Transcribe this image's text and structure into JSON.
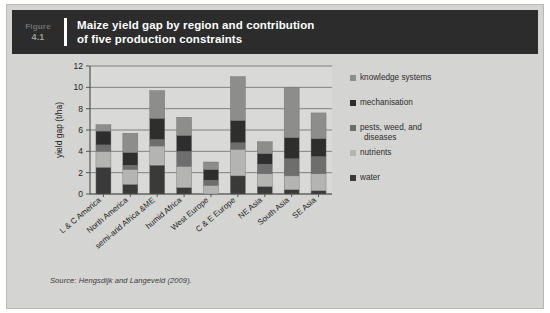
{
  "figure": {
    "label": "Figure",
    "number": "4.1",
    "title_line1": "Maize yield gap by region and contribution",
    "title_line2": "of five production constraints"
  },
  "source": {
    "prefix": "Source:",
    "text": " Hengsdijk and Langeveld (2009)."
  },
  "colors": {
    "header_bg": "#2c2c2c",
    "page_bg": "#d4d4d2",
    "plot_bg": "#d9d9d7",
    "water": "#3a3a3a",
    "nutrients": "#b4b4b2",
    "pests": "#6e6e6e",
    "mechanisation": "#2e2e2e",
    "knowledge": "#8d8d8b",
    "axis": "#555555",
    "grid": "#6b6b6b"
  },
  "chart_data": {
    "type": "bar",
    "stacked": true,
    "title": "Maize yield gap by region and contribution of five production constraints",
    "xlabel": "",
    "ylabel": "yield gap (t/ha)",
    "ylim": [
      0,
      12
    ],
    "yticks": [
      0,
      2,
      4,
      6,
      8,
      10,
      12
    ],
    "ytick_labels": [
      "0",
      "2",
      "4",
      "6",
      "8",
      "10",
      "12"
    ],
    "grid": true,
    "legend_position": "right",
    "categories": [
      "L & C America",
      "North America",
      "semi-arid Africa &ME",
      "humid Africa",
      "West Europe",
      "C & E Europe",
      "NE Asia",
      "South Asia",
      "SE Asia"
    ],
    "series": [
      {
        "name": "water",
        "color": "#3a3a3a",
        "values": [
          2.5,
          0.9,
          2.7,
          0.6,
          0.0,
          1.7,
          0.7,
          0.4,
          0.3
        ]
      },
      {
        "name": "nutrients",
        "color": "#b4b4b2",
        "values": [
          1.5,
          1.4,
          1.8,
          2.0,
          0.8,
          2.5,
          1.2,
          1.3,
          1.6
        ]
      },
      {
        "name": "pests, weed, and diseases",
        "color": "#6e6e6e",
        "values": [
          0.6,
          0.4,
          0.6,
          1.4,
          0.5,
          0.6,
          0.9,
          1.6,
          1.6
        ]
      },
      {
        "name": "mechanisation",
        "color": "#2e2e2e",
        "values": [
          1.3,
          1.2,
          2.0,
          1.5,
          1.0,
          2.1,
          1.0,
          2.0,
          1.7
        ]
      },
      {
        "name": "knowledge systems",
        "color": "#8d8d8b",
        "values": [
          0.6,
          1.8,
          2.6,
          1.7,
          0.7,
          4.1,
          1.1,
          4.7,
          2.4
        ]
      }
    ],
    "totals": [
      6.5,
      5.7,
      9.7,
      7.2,
      3.0,
      11.0,
      4.9,
      10.0,
      7.6
    ],
    "legend_entries": [
      {
        "label": "knowledge systems",
        "color": "#8d8d8b"
      },
      {
        "label": "mechanisation",
        "color": "#2e2e2e"
      },
      {
        "label": "pests, weed, and",
        "label2": "diseases",
        "color": "#6e6e6e"
      },
      {
        "label": "nutrients",
        "color": "#b4b4b2"
      },
      {
        "label": "water",
        "color": "#3a3a3a"
      }
    ]
  }
}
